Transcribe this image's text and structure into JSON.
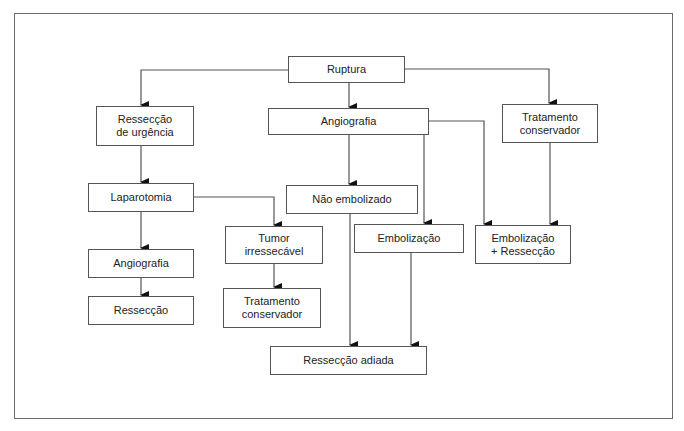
{
  "diagram": {
    "type": "flowchart",
    "nodes": {
      "ruptura": {
        "label": "Ruptura"
      },
      "resseccao_urgencia": {
        "label": "Ressecção\nde urgência"
      },
      "angiografia_top": {
        "label": "Angiografia"
      },
      "tratamento_conservador_right": {
        "label": "Tratamento\nconservador"
      },
      "laparotomia": {
        "label": "Laparotomia"
      },
      "nao_embolizado": {
        "label": "Não embolizado"
      },
      "tumor_irressecavel": {
        "label": "Tumor\nirressecável"
      },
      "embolizacao": {
        "label": "Embolização"
      },
      "embolizacao_resseccao": {
        "label": "Embolização\n+ Ressecção"
      },
      "angiografia_bottom": {
        "label": "Angiografia"
      },
      "resseccao": {
        "label": "Ressecção"
      },
      "tratamento_conservador_bottom": {
        "label": "Tratamento\nconservador"
      },
      "resseccao_adiada": {
        "label": "Ressecção adiada"
      }
    },
    "edges": [
      {
        "from": "Ruptura",
        "to": "Ressecção de urgência"
      },
      {
        "from": "Ruptura",
        "to": "Angiografia"
      },
      {
        "from": "Ruptura",
        "to": "Tratamento conservador"
      },
      {
        "from": "Ressecção de urgência",
        "to": "Laparotomia"
      },
      {
        "from": "Laparotomia",
        "to": "Angiografia"
      },
      {
        "from": "Laparotomia",
        "to": "Tumor irressecável"
      },
      {
        "from": "Angiografia",
        "to": "Ressecção"
      },
      {
        "from": "Tumor irressecável",
        "to": "Tratamento conservador"
      },
      {
        "from": "Angiografia",
        "to": "Não embolizado"
      },
      {
        "from": "Angiografia",
        "to": "Embolização"
      },
      {
        "from": "Angiografia",
        "to": "Embolização + Ressecção"
      },
      {
        "from": "Tratamento conservador",
        "to": "Embolização + Ressecção"
      },
      {
        "from": "Não embolizado",
        "to": "Ressecção adiada"
      },
      {
        "from": "Embolização",
        "to": "Ressecção adiada"
      }
    ],
    "colors": {
      "line": "#555555",
      "border": "#555555",
      "text": "#222222",
      "background": "#ffffff"
    }
  }
}
